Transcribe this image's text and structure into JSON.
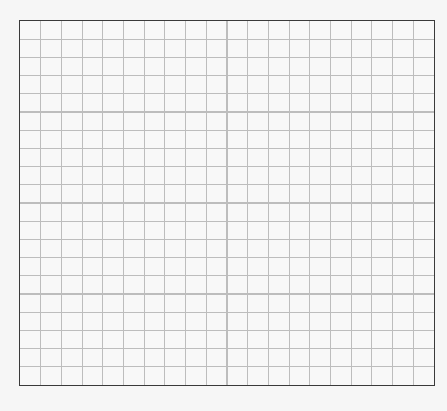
{
  "grid": {
    "columns": 20,
    "rows": 20,
    "line_color": "#bdbdbd",
    "border_color": "#3a3a3a",
    "background_color": "#f8f8f8"
  }
}
